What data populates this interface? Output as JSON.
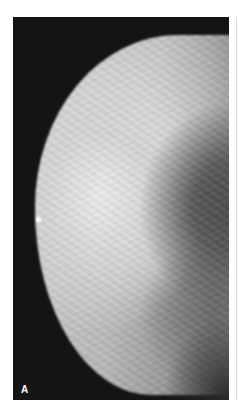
{
  "figure": {
    "panel_label": "A",
    "image_description": "Mammogram (X-ray radiograph) of breast tissue with a small bright skin marker near the left edge",
    "colors": {
      "background": "#141414",
      "tissue_bright": "#f2f2f2",
      "tissue_mid": "#8a8a8a",
      "page": "#ffffff"
    }
  }
}
